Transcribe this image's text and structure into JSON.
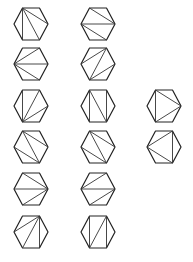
{
  "title": "Triangulations of a hexagon",
  "vertex_labels": [
    "TL",
    "TR",
    "R",
    "BR",
    "BL",
    "L"
  ],
  "colors": {
    "outline": "#222222",
    "diagonal": "#333333",
    "background": "#ffffff"
  },
  "triangulations": [
    {
      "id": 1,
      "column": 1,
      "row": 1,
      "diagonals": [
        [
          "TL",
          "R"
        ],
        [
          "TL",
          "BR"
        ],
        [
          "TL",
          "BL"
        ]
      ]
    },
    {
      "id": 2,
      "column": 2,
      "row": 1,
      "diagonals": [
        [
          "TL",
          "R"
        ],
        [
          "L",
          "R"
        ],
        [
          "L",
          "BR"
        ]
      ]
    },
    {
      "id": 3,
      "column": 1,
      "row": 2,
      "diagonals": [
        [
          "L",
          "TR"
        ],
        [
          "L",
          "R"
        ],
        [
          "L",
          "BR"
        ]
      ]
    },
    {
      "id": 4,
      "column": 2,
      "row": 2,
      "diagonals": [
        [
          "L",
          "TR"
        ],
        [
          "BL",
          "TR"
        ],
        [
          "BL",
          "R"
        ]
      ]
    },
    {
      "id": 5,
      "column": 1,
      "row": 3,
      "diagonals": [
        [
          "BL",
          "TL"
        ],
        [
          "BL",
          "TR"
        ],
        [
          "BL",
          "R"
        ]
      ]
    },
    {
      "id": 6,
      "column": 2,
      "row": 3,
      "diagonals": [
        [
          "TL",
          "BL"
        ],
        [
          "TL",
          "BR"
        ],
        [
          "TR",
          "BR"
        ]
      ]
    },
    {
      "id": 7,
      "column": 3,
      "row": 3,
      "diagonals": [
        [
          "TL",
          "BL"
        ],
        [
          "TL",
          "R"
        ],
        [
          "BL",
          "R"
        ]
      ]
    },
    {
      "id": 8,
      "column": 1,
      "row": 4,
      "diagonals": [
        [
          "TL",
          "R"
        ],
        [
          "TL",
          "BR"
        ],
        [
          "L",
          "BR"
        ]
      ]
    },
    {
      "id": 9,
      "column": 2,
      "row": 4,
      "diagonals": [
        [
          "TL",
          "R"
        ],
        [
          "TL",
          "BR"
        ],
        [
          "L",
          "BR"
        ]
      ]
    },
    {
      "id": 10,
      "column": 3,
      "row": 4,
      "diagonals": [
        [
          "TR",
          "BR"
        ],
        [
          "L",
          "TR"
        ],
        [
          "L",
          "BR"
        ]
      ]
    },
    {
      "id": 11,
      "column": 1,
      "row": 5,
      "diagonals": [
        [
          "R",
          "TL"
        ],
        [
          "R",
          "L"
        ],
        [
          "R",
          "BL"
        ]
      ]
    },
    {
      "id": 12,
      "column": 2,
      "row": 5,
      "diagonals": [
        [
          "L",
          "TR"
        ],
        [
          "L",
          "R"
        ],
        [
          "BL",
          "R"
        ]
      ]
    },
    {
      "id": 13,
      "column": 1,
      "row": 6,
      "diagonals": [
        [
          "TR",
          "L"
        ],
        [
          "TR",
          "BL"
        ],
        [
          "TR",
          "BR"
        ]
      ]
    },
    {
      "id": 14,
      "column": 2,
      "row": 6,
      "diagonals": [
        [
          "TL",
          "BL"
        ],
        [
          "TR",
          "BL"
        ],
        [
          "TR",
          "BR"
        ]
      ]
    }
  ]
}
